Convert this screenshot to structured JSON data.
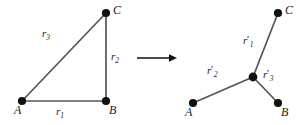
{
  "figure": {
    "type": "diagram",
    "width": 303,
    "height": 125,
    "background_color": "#ffffff",
    "line_color": "#555555",
    "node_color": "#111111",
    "text_color": "#1a1a1a"
  },
  "left_diagram": {
    "name": "triangle",
    "vertices": [
      {
        "id": "A",
        "label": "A",
        "x": 22,
        "y": 101,
        "label_x": 14,
        "label_y": 106
      },
      {
        "id": "B",
        "label": "B",
        "x": 106,
        "y": 101,
        "label_x": 109,
        "label_y": 106
      },
      {
        "id": "C",
        "label": "C",
        "x": 106,
        "y": 13,
        "label_x": 113,
        "label_y": 5
      }
    ],
    "edges": [
      {
        "id": "r1",
        "label": "r",
        "subscript": "1",
        "from": "A",
        "to": "B",
        "label_x": 56,
        "label_y": 108
      },
      {
        "id": "r2",
        "label": "r",
        "subscript": "2",
        "from": "B",
        "to": "C",
        "label_x": 111,
        "label_y": 51
      },
      {
        "id": "r3",
        "label": "r",
        "subscript": "3",
        "from": "A",
        "to": "C",
        "label_x": 42,
        "label_y": 29
      }
    ]
  },
  "arrow": {
    "name": "transform-arrow",
    "x1": 137,
    "y1": 58,
    "x2": 177,
    "y2": 58
  },
  "right_diagram": {
    "name": "star-topology",
    "vertices": [
      {
        "id": "A-prime",
        "label": "A",
        "x": 193,
        "y": 103,
        "label_x": 185,
        "label_y": 108
      },
      {
        "id": "B-prime",
        "label": "B",
        "x": 278,
        "y": 103,
        "label_x": 281,
        "label_y": 108
      },
      {
        "id": "C-prime",
        "label": "C",
        "x": 278,
        "y": 13,
        "label_x": 285,
        "label_y": 5
      },
      {
        "id": "junction",
        "label": "",
        "x": 253,
        "y": 77,
        "label_x": 0,
        "label_y": 0
      }
    ],
    "edges": [
      {
        "id": "r1-prime",
        "label": "r",
        "subscript": "1",
        "prime": "′",
        "from": "junction",
        "to": "C-prime",
        "label_x": 243,
        "label_y": 36
      },
      {
        "id": "r2-prime",
        "label": "r",
        "subscript": "2",
        "prime": "′",
        "from": "A-prime",
        "to": "junction",
        "label_x": 207,
        "label_y": 66
      },
      {
        "id": "r3-prime",
        "label": "r",
        "subscript": "3",
        "prime": "′",
        "from": "junction",
        "to": "B-prime",
        "label_x": 263,
        "label_y": 70
      }
    ]
  }
}
